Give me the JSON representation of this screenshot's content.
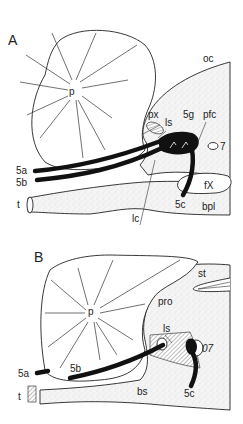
{
  "figure": {
    "panels": [
      {
        "id": "A",
        "label": "A",
        "structures": {
          "p": "p",
          "oc": "oc",
          "px": "px",
          "ls": "ls",
          "g5": "5g",
          "pfc": "pfc",
          "n7": "7",
          "a5": "5a",
          "b5": "5b",
          "fX": "fX",
          "c5": "5c",
          "bpl": "bpl",
          "t": "t",
          "lc": "lc"
        }
      },
      {
        "id": "B",
        "label": "B",
        "structures": {
          "p": "p",
          "st": "st",
          "pro": "pro",
          "ls": "ls",
          "n7": "07",
          "a5": "5a",
          "b5": "5b",
          "c5": "5c",
          "bs": "bs",
          "t": "t"
        }
      }
    ]
  }
}
